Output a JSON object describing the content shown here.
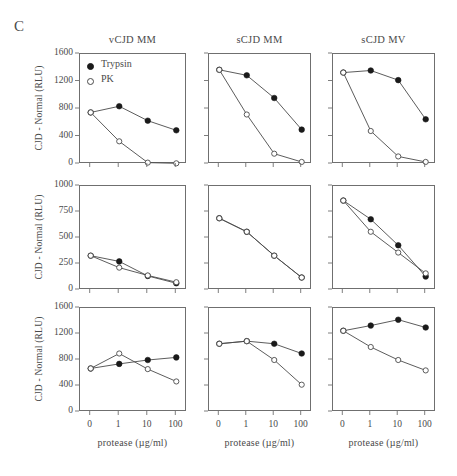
{
  "figure": {
    "panel_letter": "C",
    "column_titles": [
      "vCJD MM",
      "sCJD MM",
      "sCJD MV"
    ],
    "y_axis_label": "CJD - Normal (RLU)",
    "x_axis_label": "protease (µg/ml)",
    "legend": [
      {
        "label": "Trypsin",
        "marker": "filled-circle"
      },
      {
        "label": "PK",
        "marker": "open-circle"
      }
    ],
    "colors": {
      "line": "#4a4a4a",
      "frame": "#6f6f6f",
      "marker_fill": "#1a1a1a",
      "marker_open": "#ffffff",
      "text": "#4a4a4a",
      "background": "#ffffff"
    }
  },
  "chart_data": [
    {
      "type": "line",
      "id": "row1-col1",
      "title": "vCJD MM",
      "row": 1,
      "col": 1,
      "xlabel": "protease (µg/ml)",
      "ylabel": "CJD - Normal (RLU)",
      "categories": [
        "0",
        "1",
        "10",
        "100"
      ],
      "yticks": [
        0,
        400,
        800,
        1200,
        1600
      ],
      "ylim": [
        0,
        1600
      ],
      "grid": false,
      "legend_position": "top-left",
      "series": [
        {
          "name": "Trypsin",
          "marker": "filled-circle",
          "values": [
            750,
            840,
            630,
            490
          ]
        },
        {
          "name": "PK",
          "marker": "open-circle",
          "values": [
            750,
            330,
            20,
            10
          ]
        }
      ]
    },
    {
      "type": "line",
      "id": "row1-col2",
      "title": "sCJD MM",
      "row": 1,
      "col": 2,
      "xlabel": "protease (µg/ml)",
      "ylabel": "",
      "categories": [
        "0",
        "1",
        "10",
        "100"
      ],
      "yticks": [
        0,
        400,
        800,
        1200,
        1600
      ],
      "ylim": [
        0,
        1600
      ],
      "grid": false,
      "legend_position": "none",
      "series": [
        {
          "name": "Trypsin",
          "marker": "filled-circle",
          "values": [
            1370,
            1290,
            960,
            500
          ]
        },
        {
          "name": "PK",
          "marker": "open-circle",
          "values": [
            1370,
            720,
            150,
            30
          ]
        }
      ]
    },
    {
      "type": "line",
      "id": "row1-col3",
      "title": "sCJD MV",
      "row": 1,
      "col": 3,
      "xlabel": "protease (µg/ml)",
      "ylabel": "",
      "categories": [
        "0",
        "1",
        "10",
        "100"
      ],
      "yticks": [
        0,
        400,
        800,
        1200,
        1600
      ],
      "ylim": [
        0,
        1600
      ],
      "grid": false,
      "legend_position": "none",
      "series": [
        {
          "name": "Trypsin",
          "marker": "filled-circle",
          "values": [
            1330,
            1360,
            1220,
            650
          ]
        },
        {
          "name": "PK",
          "marker": "open-circle",
          "values": [
            1330,
            480,
            110,
            30
          ]
        }
      ]
    },
    {
      "type": "line",
      "id": "row2-col1",
      "title": "",
      "row": 2,
      "col": 1,
      "xlabel": "protease (µg/ml)",
      "ylabel": "CJD - Normal (RLU)",
      "categories": [
        "0",
        "1",
        "10",
        "100"
      ],
      "yticks": [
        0,
        250,
        500,
        750,
        1000
      ],
      "ylim": [
        0,
        1000
      ],
      "grid": false,
      "legend_position": "none",
      "series": [
        {
          "name": "Trypsin",
          "marker": "filled-circle",
          "values": [
            330,
            275,
            135,
            65
          ]
        },
        {
          "name": "PK",
          "marker": "open-circle",
          "values": [
            330,
            215,
            140,
            75
          ]
        }
      ]
    },
    {
      "type": "line",
      "id": "row2-col2",
      "title": "",
      "row": 2,
      "col": 2,
      "xlabel": "protease (µg/ml)",
      "ylabel": "",
      "categories": [
        "0",
        "1",
        "10",
        "100"
      ],
      "yticks": [
        0,
        250,
        500,
        750,
        1000
      ],
      "ylim": [
        0,
        1000
      ],
      "grid": false,
      "legend_position": "none",
      "series": [
        {
          "name": "Trypsin",
          "marker": "filled-circle",
          "values": [
            690,
            560,
            330,
            120
          ]
        },
        {
          "name": "PK",
          "marker": "open-circle",
          "values": [
            690,
            560,
            330,
            120
          ]
        }
      ]
    },
    {
      "type": "line",
      "id": "row2-col3",
      "title": "",
      "row": 2,
      "col": 3,
      "xlabel": "protease (µg/ml)",
      "ylabel": "",
      "categories": [
        "0",
        "1",
        "10",
        "100"
      ],
      "yticks": [
        0,
        250,
        500,
        750,
        1000
      ],
      "ylim": [
        0,
        1000
      ],
      "grid": false,
      "legend_position": "none",
      "series": [
        {
          "name": "Trypsin",
          "marker": "filled-circle",
          "values": [
            860,
            680,
            430,
            130
          ]
        },
        {
          "name": "PK",
          "marker": "open-circle",
          "values": [
            860,
            560,
            360,
            160
          ]
        }
      ]
    },
    {
      "type": "line",
      "id": "row3-col1",
      "title": "",
      "row": 3,
      "col": 1,
      "xlabel": "protease (µg/ml)",
      "ylabel": "CJD - Normal (RLU)",
      "categories": [
        "0",
        "1",
        "10",
        "100"
      ],
      "yticks": [
        0,
        400,
        800,
        1200,
        1600
      ],
      "ylim": [
        0,
        1600
      ],
      "grid": false,
      "legend_position": "none",
      "series": [
        {
          "name": "Trypsin",
          "marker": "filled-circle",
          "values": [
            670,
            740,
            800,
            840
          ]
        },
        {
          "name": "PK",
          "marker": "open-circle",
          "values": [
            670,
            900,
            660,
            470
          ]
        }
      ]
    },
    {
      "type": "line",
      "id": "row3-col2",
      "title": "",
      "row": 3,
      "col": 2,
      "xlabel": "protease (µg/ml)",
      "ylabel": "",
      "categories": [
        "0",
        "1",
        "10",
        "100"
      ],
      "yticks": [
        0,
        400,
        800,
        1200,
        1600
      ],
      "ylim": [
        0,
        1600
      ],
      "grid": false,
      "legend_position": "none",
      "series": [
        {
          "name": "Trypsin",
          "marker": "filled-circle",
          "values": [
            1050,
            1090,
            1050,
            900
          ]
        },
        {
          "name": "PK",
          "marker": "open-circle",
          "values": [
            1050,
            1090,
            800,
            420
          ]
        }
      ]
    },
    {
      "type": "line",
      "id": "row3-col3",
      "title": "",
      "row": 3,
      "col": 3,
      "xlabel": "protease (µg/ml)",
      "ylabel": "",
      "categories": [
        "0",
        "1",
        "10",
        "100"
      ],
      "yticks": [
        0,
        400,
        800,
        1200,
        1600
      ],
      "ylim": [
        0,
        1600
      ],
      "grid": false,
      "legend_position": "none",
      "series": [
        {
          "name": "Trypsin",
          "marker": "filled-circle",
          "values": [
            1250,
            1330,
            1420,
            1300
          ]
        },
        {
          "name": "PK",
          "marker": "open-circle",
          "values": [
            1250,
            1000,
            800,
            640
          ]
        }
      ]
    }
  ]
}
